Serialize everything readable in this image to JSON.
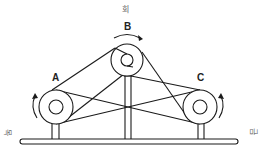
{
  "diagram": {
    "type": "belt-pulley-system",
    "labels": {
      "top": "회",
      "left": "목",
      "right": "금",
      "pulley_a": "A",
      "pulley_b": "B",
      "pulley_c": "C"
    },
    "pulleys": [
      {
        "id": "A",
        "cx": 56,
        "cy": 107,
        "outer_r": 17,
        "inner_r": 7,
        "rotation": "counter-clockwise"
      },
      {
        "id": "B",
        "cx": 127,
        "cy": 60,
        "outer_r": 16,
        "inner_r": 6,
        "rotation": "clockwise"
      },
      {
        "id": "C",
        "cx": 200,
        "cy": 107,
        "outer_r": 17,
        "inner_r": 7,
        "rotation": "counter-clockwise"
      }
    ],
    "colors": {
      "stroke": "#1a1a1a",
      "background": "#ffffff"
    }
  }
}
